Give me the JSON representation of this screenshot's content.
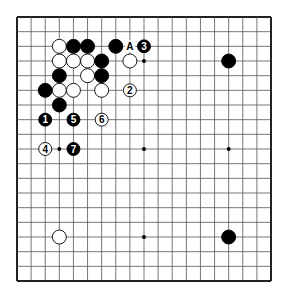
{
  "diagram": {
    "type": "go-board",
    "size": 19,
    "colors": {
      "background": "#ffffff",
      "line": "#555555",
      "edge": "#222222",
      "black": "#000000",
      "white": "#ffffff"
    },
    "star_points": [
      [
        3,
        3
      ],
      [
        9,
        3
      ],
      [
        15,
        3
      ],
      [
        3,
        9
      ],
      [
        9,
        9
      ],
      [
        15,
        9
      ],
      [
        3,
        15
      ],
      [
        9,
        15
      ],
      [
        15,
        15
      ]
    ],
    "stones": [
      {
        "color": "white",
        "col": 3,
        "row": 2
      },
      {
        "color": "black",
        "col": 4,
        "row": 2
      },
      {
        "color": "black",
        "col": 5,
        "row": 2
      },
      {
        "color": "black",
        "col": 7,
        "row": 2
      },
      {
        "color": "black",
        "col": 9,
        "row": 2,
        "label": "3"
      },
      {
        "color": "white",
        "col": 3,
        "row": 3
      },
      {
        "color": "white",
        "col": 4,
        "row": 3
      },
      {
        "color": "white",
        "col": 5,
        "row": 3
      },
      {
        "color": "black",
        "col": 6,
        "row": 3
      },
      {
        "color": "white",
        "col": 8,
        "row": 3
      },
      {
        "color": "black",
        "col": 3,
        "row": 4
      },
      {
        "color": "white",
        "col": 5,
        "row": 4
      },
      {
        "color": "black",
        "col": 6,
        "row": 4
      },
      {
        "color": "black",
        "col": 2,
        "row": 5
      },
      {
        "color": "white",
        "col": 3,
        "row": 5
      },
      {
        "color": "white",
        "col": 4,
        "row": 5
      },
      {
        "color": "white",
        "col": 6,
        "row": 5
      },
      {
        "color": "white",
        "col": 8,
        "row": 5,
        "label": "2"
      },
      {
        "color": "black",
        "col": 3,
        "row": 6
      },
      {
        "color": "black",
        "col": 2,
        "row": 7,
        "label": "1"
      },
      {
        "color": "black",
        "col": 4,
        "row": 7,
        "label": "5"
      },
      {
        "color": "white",
        "col": 6,
        "row": 7,
        "label": "6"
      },
      {
        "color": "white",
        "col": 2,
        "row": 9,
        "label": "4"
      },
      {
        "color": "black",
        "col": 4,
        "row": 9,
        "label": "7"
      },
      {
        "color": "black",
        "col": 15,
        "row": 3
      },
      {
        "color": "white",
        "col": 3,
        "row": 15
      },
      {
        "color": "black",
        "col": 15,
        "row": 15
      }
    ],
    "markers": [
      {
        "col": 8,
        "row": 2,
        "text": "A"
      }
    ]
  }
}
